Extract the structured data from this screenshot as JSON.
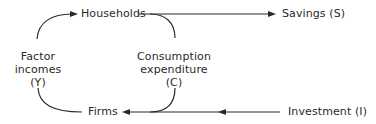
{
  "diagram": {
    "type": "circular-flow",
    "nodes": {
      "households": "Households",
      "firms": "Firms",
      "savings": "Savings (S)",
      "investment": "Investment (I)",
      "factor_incomes": [
        "Factor",
        "incomes",
        "(Y)"
      ],
      "consumption": [
        "Consumption",
        "expenditure",
        "(C)"
      ]
    },
    "edges": [
      {
        "from": "Firms",
        "to": "Households",
        "label": "Factor incomes (Y)"
      },
      {
        "from": "Households",
        "to": "Firms",
        "label": "Consumption expenditure (C)"
      },
      {
        "from": "Households",
        "to": "Savings (S)",
        "label": ""
      },
      {
        "from": "Investment (I)",
        "to": "Firms",
        "label": ""
      }
    ]
  }
}
